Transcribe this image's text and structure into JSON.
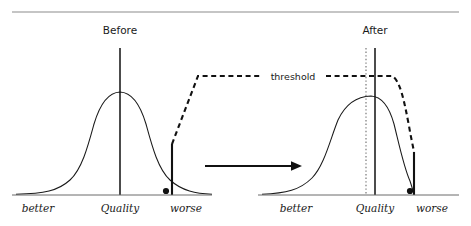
{
  "figure": {
    "type": "diagram",
    "top_rule": {
      "visible": true,
      "color": "#8c8c8c"
    },
    "colors": {
      "ink": "#1a1a1a",
      "rule": "#8c8c8c",
      "axis": "#6b6b6b",
      "dashed": "#111111",
      "dotted": "#8a8a8a"
    }
  },
  "panels": [
    {
      "id": "before",
      "title": "Before",
      "title_x": 120,
      "title_y": 34,
      "axis": {
        "x1": 12,
        "x2": 212,
        "y": 195
      },
      "axis_labels": [
        {
          "text": "better",
          "x": 38,
          "y": 212
        },
        {
          "text": "Quality",
          "x": 120,
          "y": 212
        },
        {
          "text": "worse",
          "x": 186,
          "y": 212
        }
      ],
      "mean_line": {
        "x": 120,
        "y_top": 48,
        "y_bottom": 195
      },
      "curve": {
        "peak_x": 120,
        "peak_y": 92,
        "spread": "wide",
        "shape": "normal"
      },
      "tick": {
        "x": 172,
        "y_top": 144,
        "y_bottom": 195
      },
      "dot": {
        "x": 166,
        "y": 191,
        "r": 3.1
      }
    },
    {
      "id": "after",
      "title": "After",
      "title_x": 375,
      "title_y": 34,
      "axis": {
        "x1": 258,
        "x2": 459,
        "y": 195
      },
      "axis_labels": [
        {
          "text": "better",
          "x": 296,
          "y": 212
        },
        {
          "text": "Quality",
          "x": 375,
          "y": 212
        },
        {
          "text": "worse",
          "x": 432,
          "y": 212
        }
      ],
      "mean_line": {
        "x": 375,
        "y_top": 48,
        "y_bottom": 195
      },
      "dotted_line": {
        "x": 366,
        "y_top": 48,
        "y_bottom": 195
      },
      "curve": {
        "peak_x": 371,
        "peak_y": 96,
        "spread": "narrow",
        "shape": "normal-truncated"
      },
      "tick": {
        "x": 414,
        "y_top": 152,
        "y_bottom": 195
      },
      "dot": {
        "x": 410,
        "y": 191,
        "r": 3.1
      }
    }
  ],
  "threshold": {
    "label": "threshold",
    "label_x": 293,
    "label_y": 79,
    "plateau_y": 76,
    "left_foot_x": 172,
    "left_foot_y": 144,
    "plateau_start_x": 198,
    "plateau_end_x": 398,
    "right_foot_x": 414,
    "right_foot_y": 152
  },
  "arrow": {
    "name": "transition-arrow",
    "x1": 205,
    "x2": 302,
    "y": 166,
    "head_size": 9
  }
}
